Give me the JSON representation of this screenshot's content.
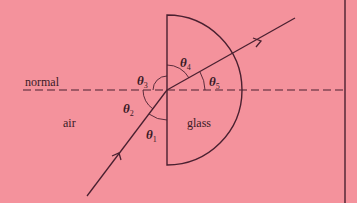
{
  "diagram": {
    "title": "",
    "colors": {
      "background": "#F4929C",
      "line": "#4a2030",
      "text": "#3a1a26"
    },
    "labels": {
      "normal": "normal",
      "air": "air",
      "glass": "glass"
    },
    "angles": [
      {
        "symbol": "θ",
        "sub": "1"
      },
      {
        "symbol": "θ",
        "sub": "2"
      },
      {
        "symbol": "θ",
        "sub": "3"
      },
      {
        "symbol": "θ",
        "sub": "4"
      },
      {
        "symbol": "θ",
        "sub": "5"
      }
    ]
  }
}
